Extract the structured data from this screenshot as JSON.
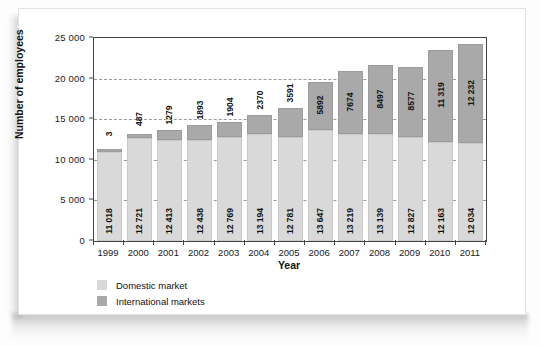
{
  "chart_data": {
    "type": "bar",
    "subtype": "stacked-vertical",
    "title": "",
    "xlabel": "Year",
    "ylabel": "Number of employees",
    "categories": [
      "1999",
      "2000",
      "2001",
      "2002",
      "2003",
      "2004",
      "2005",
      "2006",
      "2007",
      "2008",
      "2009",
      "2010",
      "2011"
    ],
    "series": [
      {
        "name": "Domestic market",
        "color": "#d9d9d9",
        "values": [
          11018,
          12721,
          12413,
          12438,
          12769,
          13194,
          12781,
          13647,
          13219,
          13139,
          12827,
          12163,
          12034
        ],
        "labels": [
          "11 018",
          "12 721",
          "12 413",
          "12 438",
          "12 769",
          "13 194",
          "12 781",
          "13 647",
          "13 219",
          "13 139",
          "12 827",
          "12 163",
          "12 034"
        ]
      },
      {
        "name": "International markets",
        "color": "#a9a9a9",
        "values": [
          3,
          487,
          1279,
          1893,
          1904,
          2370,
          3591,
          5892,
          7674,
          8497,
          8577,
          11319,
          12232
        ],
        "labels": [
          "3",
          "487",
          "1279",
          "1893",
          "1904",
          "2370",
          "3591",
          "5892",
          "7674",
          "8497",
          "8577",
          "11 319",
          "12 232"
        ]
      }
    ],
    "ylim": [
      0,
      25000
    ],
    "yticks": [
      0,
      5000,
      10000,
      15000,
      20000,
      25000
    ],
    "ytick_labels": [
      "0",
      "5 000",
      "10 000",
      "15 000",
      "20 000",
      "25 000"
    ],
    "grid": "horizontal-dashed",
    "legend_position": "bottom-left"
  },
  "axes": {
    "y_title": "Number of employees",
    "x_title": "Year"
  },
  "legend": {
    "items": [
      {
        "label": "Domestic market",
        "color": "#d9d9d9"
      },
      {
        "label": "International markets",
        "color": "#a9a9a9"
      }
    ]
  }
}
